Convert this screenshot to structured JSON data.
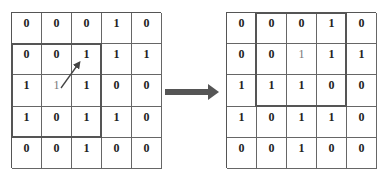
{
  "left_grid": {
    "rows": [
      [
        "0",
        "0",
        "0",
        "1",
        "0"
      ],
      [
        "0",
        "0",
        "1",
        "1",
        "1"
      ],
      [
        "1",
        "1",
        "1",
        "0",
        "0"
      ],
      [
        "1",
        "0",
        "1",
        "1",
        "0"
      ],
      [
        "0",
        "0",
        "1",
        "0",
        "0"
      ]
    ],
    "highlight_window": {
      "rows": [
        1,
        3
      ],
      "cols": [
        0,
        2
      ]
    },
    "light_cells": [
      [
        2,
        1
      ]
    ],
    "arrow": {
      "from": [
        2,
        1
      ],
      "to": [
        1,
        2
      ]
    }
  },
  "transition_arrow": {
    "direction": "right",
    "color": "#555555"
  },
  "right_grid": {
    "rows": [
      [
        "0",
        "0",
        "0",
        "1",
        "0"
      ],
      [
        "0",
        "0",
        "1",
        "1",
        "1"
      ],
      [
        "1",
        "1",
        "1",
        "0",
        "0"
      ],
      [
        "1",
        "0",
        "1",
        "1",
        "0"
      ],
      [
        "0",
        "0",
        "1",
        "0",
        "0"
      ]
    ],
    "highlight_window": {
      "rows": [
        0,
        2
      ],
      "cols": [
        1,
        3
      ]
    },
    "light_cells": [
      [
        1,
        2
      ]
    ]
  }
}
